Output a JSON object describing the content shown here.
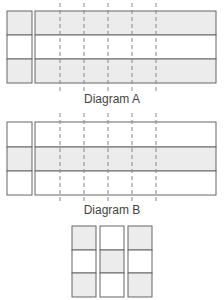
{
  "diagram_a": {
    "label": "Diagram A",
    "rows_shaded": [
      true,
      false,
      true
    ]
  },
  "diagram_b": {
    "label": "Diagram B",
    "rows_shaded": [
      false,
      true,
      false
    ]
  },
  "diagram_c": {
    "columns": [
      [
        true,
        false,
        true
      ],
      [
        false,
        true,
        false
      ],
      [
        true,
        false,
        true
      ]
    ]
  },
  "colors": {
    "shade": "#ececec",
    "stroke": "#666666",
    "dash": "#888888"
  },
  "dashed_lines_x": [
    60,
    84,
    108,
    132,
    156
  ]
}
